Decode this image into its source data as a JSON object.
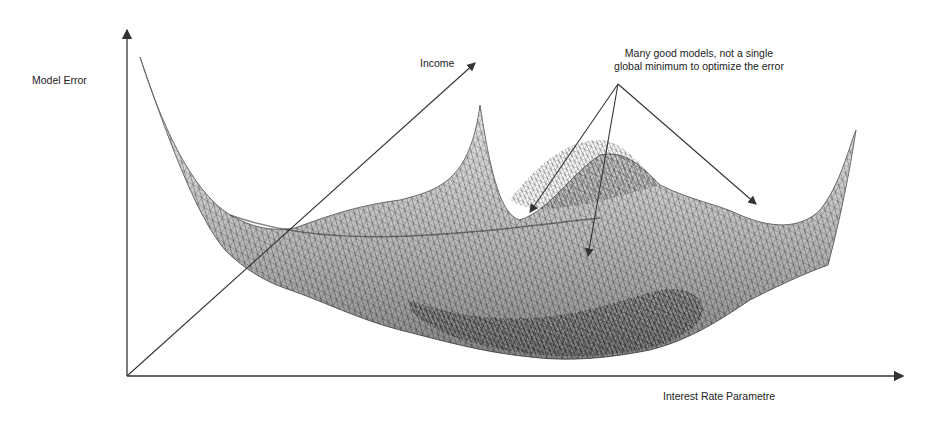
{
  "diagram": {
    "axes": {
      "y_label": "Model Error",
      "depth_label": "Income",
      "x_label": "Interest Rate Parametre"
    },
    "annotation": {
      "line1": "Many good models,  not a single",
      "line2": "global minimum to optimize the error",
      "arrow_count": 3
    },
    "surface": {
      "style": "wireframe mesh",
      "color": "#555555",
      "features": [
        "steep left wall",
        "central peak",
        "hump",
        "right rising corner",
        "multiple local minima"
      ]
    },
    "colors": {
      "axis": "#333333",
      "text": "#222222",
      "background": "#ffffff"
    }
  }
}
